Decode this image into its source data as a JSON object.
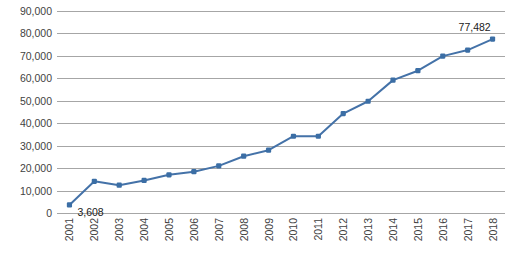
{
  "chart_data": {
    "type": "line",
    "title": "",
    "subtitle": "",
    "xlabel": "",
    "ylabel": "",
    "categories": [
      "2001",
      "2002",
      "2003",
      "2004",
      "2005",
      "2006",
      "2007",
      "2008",
      "2009",
      "2010",
      "2011",
      "2012",
      "2013",
      "2014",
      "2015",
      "2016",
      "2017",
      "2018"
    ],
    "values": [
      3608,
      14100,
      12400,
      14500,
      17000,
      18400,
      21000,
      25300,
      28000,
      34200,
      34200,
      44300,
      49800,
      59200,
      63400,
      69900,
      72600,
      77482
    ],
    "series": [
      {
        "name": "",
        "values": [
          3608,
          14100,
          12400,
          14500,
          17000,
          18400,
          21000,
          25300,
          28000,
          34200,
          34200,
          44300,
          49800,
          59200,
          63400,
          69900,
          72600,
          77482
        ]
      }
    ],
    "point_labels": [
      {
        "index": 0,
        "text": "3,608"
      },
      {
        "index": 17,
        "text": "77,482"
      }
    ],
    "ylim": [
      0,
      90000
    ],
    "yticks": [
      0,
      10000,
      20000,
      30000,
      40000,
      50000,
      60000,
      70000,
      80000,
      90000
    ],
    "ytick_labels": [
      "0",
      "10,000",
      "20,000",
      "30,000",
      "40,000",
      "50,000",
      "60,000",
      "70,000",
      "80,000",
      "90,000"
    ],
    "grid": "horizontal",
    "legend": "none",
    "colors": {
      "line": "#4472a8",
      "marker": "#3b6ea5",
      "gridline": "#a6a6a6",
      "text": "#3f3f3f",
      "background": "#ffffff"
    },
    "marker_style": "square",
    "x_tick_label_rotation": 90
  }
}
